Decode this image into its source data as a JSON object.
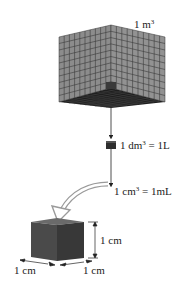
{
  "diagram": {
    "big_cube": {
      "label": "1 m",
      "exponent": "3",
      "grid_divisions": 10,
      "face_color": "#8a8a8a",
      "grid_color": "#3a3a3a",
      "bottom_color": "#1e1e1e"
    },
    "medium_cube": {
      "label": "1 dm",
      "exponent": "3",
      "equals": " = 1L",
      "color": "#2e2e2e"
    },
    "small_label": {
      "label": "1 cm",
      "exponent": "3",
      "equals": " = 1mL"
    },
    "small_cube": {
      "height_label": "1 cm",
      "width_left_label": "1 cm",
      "width_right_label": "1 cm",
      "left_face_color": "#4a4a4a",
      "right_face_color": "#3a3a3a",
      "top_face_color": "#6a6a6a"
    },
    "curved_arrow_color": "#9a9a9a",
    "line_color": "#333333"
  }
}
